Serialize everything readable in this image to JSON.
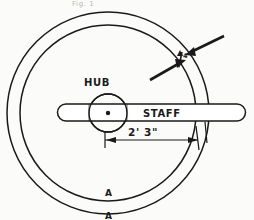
{
  "figure": {
    "title_caption": "Fig. 1",
    "background_color": "#fbfbf9",
    "ink_color": "#1a1a1a",
    "labels": {
      "hub": "HUB",
      "staff": "STAFF",
      "dimension_span": "2' 3\"",
      "rim_thickness": "4\"",
      "section_mark_upper": "A",
      "section_mark_lower": "A"
    }
  },
  "geometry": {
    "outer_circle": {
      "cx": 108,
      "cy": 113,
      "r": 101
    },
    "inner_circle": {
      "cx": 108,
      "cy": 113,
      "r": 88
    },
    "hub_circle": {
      "cx": 108,
      "cy": 113,
      "r": 19
    },
    "hub_center_dot": {
      "cx": 108,
      "cy": 113,
      "r": 2
    },
    "staff": {
      "x1": 57,
      "x2": 246,
      "y_top": 104,
      "y_bottom": 121
    },
    "dimension": {
      "x_start": 105,
      "x_end": 197,
      "y": 140
    }
  },
  "annotations": {
    "rim_arrow_upper_right": "arrow pointing to outer rim band",
    "rim_arrow_lower_left": "arrow pointing to outer rim band"
  }
}
